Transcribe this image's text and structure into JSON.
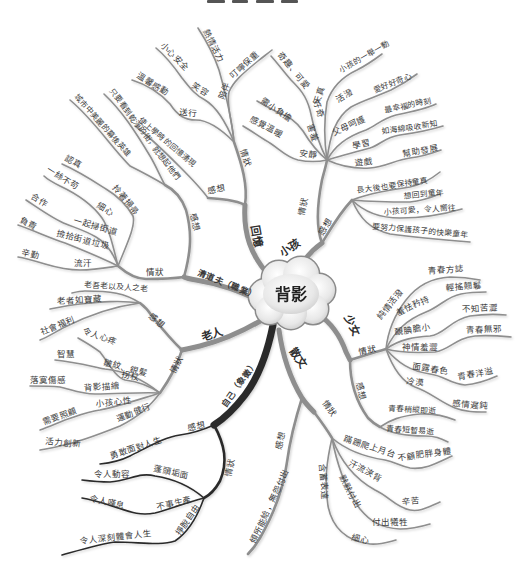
{
  "center": {
    "label": "背影"
  },
  "colors": {
    "line": "#8e8e8e",
    "dark_line": "#2b2b2b",
    "text": "#3a3a3a",
    "cloud_fill": "#e6e6e6",
    "cloud_stroke": "#8a8a8a"
  },
  "branches": {
    "memory": {
      "label": "回憶",
      "situation": {
        "label": "情狀",
        "items": [
          {
            "outer": "熱情活力"
          },
          {
            "inner": "陪伴",
            "outer": "叮嚀保重"
          },
          {
            "inner": "笑容",
            "outer": "小心安全"
          },
          {
            "inner": "送行",
            "outer": "溫馨感動"
          }
        ]
      },
      "reflection": {
        "label": "感想",
        "items": [
          {
            "text": "使上學時的回憶湧現"
          }
        ]
      }
    },
    "sweeper": {
      "label": "清道夫（職業）",
      "reflection": {
        "label": "感想",
        "items": [
          {
            "text": "城市中美麗的幕後英雄"
          },
          {
            "text": "只要看到乾淨的街，就想起他們"
          }
        ]
      },
      "situation": {
        "label": "情狀",
        "items": [
          {
            "inner": "拎著掃帚",
            "outer": "認真"
          },
          {
            "inner": "細心",
            "outer": "一絲不苟"
          },
          {
            "inner": "一起掃街道",
            "outer": "合作"
          },
          {
            "inner": "撿拾街道垃圾",
            "outer": "負責"
          },
          {
            "inner": "流汗",
            "outer": "辛勤"
          }
        ]
      }
    },
    "elder": {
      "label": "老人",
      "reflection": {
        "label": "感想",
        "items": [
          {
            "text": "老吾老以及人之老"
          },
          {
            "text": "老者如寶藏"
          },
          {
            "text": "社會福利"
          }
        ]
      },
      "situation": {
        "label": "情狀",
        "items": [
          {
            "inner": "拐杖",
            "outer": "令人心疼"
          },
          {
            "inner": "皺紋、銀髮",
            "outer": "智慧"
          },
          {
            "inner": "背影描繪",
            "outer": "落寞傷感"
          },
          {
            "inner": "小孩心性",
            "outer": "需要照顧"
          },
          {
            "inner": "運動健行",
            "outer": "活力創新"
          }
        ]
      }
    },
    "self": {
      "label": "自己（象徵）",
      "reflection": {
        "label": "感想",
        "items": [
          {
            "text": "勇敢面對人生"
          }
        ]
      },
      "situation": {
        "label": "情狀",
        "items": [
          {
            "inner": "蓬頭垢面",
            "outer": "令人動容"
          },
          {
            "inner": "不事生產",
            "outer": "令人嘆息"
          },
          {
            "inner": "掙脫自由",
            "outer": "令人深刻體會人生"
          }
        ]
      }
    },
    "prose": {
      "label": "散文",
      "reflection": {
        "label": "感想",
        "items": [
          {
            "text": "傾所能給，無怨付出"
          }
        ]
      },
      "situation": {
        "label": "情狀",
        "items": [
          {
            "inner": "蹣跚爬上月台",
            "outer": "不顧肥胖身體"
          },
          {
            "inner": "汗流浹背",
            "outer": "辛苦"
          },
          {
            "inner": "默默付出",
            "outer": "付出犧牲"
          },
          {
            "inner": "含蓄表達",
            "outer": "細心"
          }
        ]
      }
    },
    "girl": {
      "label": "少女",
      "situation": {
        "label": "情狀",
        "items": [
          {
            "inner": "純情活潑",
            "outer": "青春方誌"
          },
          {
            "inner": "羞怯矜持",
            "outer": "輕搖翹鬈"
          },
          {
            "inner": "靦腆膽小",
            "outer": "不知苦澀"
          },
          {
            "inner": "神情羞澀",
            "outer": "青春無邪"
          },
          {
            "inner": "面露春色",
            "outer": "青春洋溢"
          },
          {
            "inner": "冷漠",
            "outer": "感情遲鈍"
          }
        ]
      },
      "reflection": {
        "label": "感想",
        "items": [
          {
            "text": "青春稍縱即逝"
          },
          {
            "text": "青春短暫易逝"
          }
        ]
      }
    },
    "child": {
      "label": "小孩",
      "reflection": {
        "label": "感想",
        "items": [
          {
            "text": "長大後也要保持童真"
          },
          {
            "text": "想回到童年"
          },
          {
            "text": "小孩可愛，令人嚮往"
          },
          {
            "text": "要努力保護孩子的快樂童年"
          }
        ]
      },
      "situation": {
        "label": "情狀",
        "items": [
          {
            "inner": "天真",
            "outer": "小孩的一舉一動"
          },
          {
            "inner": "活潑",
            "outer": "愛好好奇心"
          },
          {
            "inner": "父母呵護",
            "outer": "最幸福的時刻"
          },
          {
            "inner": "學習",
            "outer": "如海綿吸收新知"
          },
          {
            "inner": "遊戲",
            "outer": "幫助發展"
          },
          {
            "inner": "好奇",
            "outer": "奇趣、可愛"
          },
          {
            "inner": "害羞",
            "outer": "需小負擔"
          },
          {
            "inner": "安靜",
            "outer": "感覺溫暖"
          }
        ]
      }
    }
  }
}
